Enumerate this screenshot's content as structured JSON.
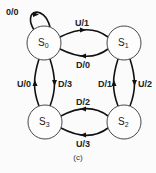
{
  "diagram": {
    "type": "state-machine",
    "caption": "(c)",
    "states": [
      {
        "id": "S0",
        "name": "S",
        "sub": "0",
        "cx": 44,
        "cy": 43
      },
      {
        "id": "S1",
        "name": "S",
        "sub": "1",
        "cx": 124,
        "cy": 43
      },
      {
        "id": "S2",
        "name": "S",
        "sub": "2",
        "cx": 124,
        "cy": 122
      },
      {
        "id": "S3",
        "name": "S",
        "sub": "3",
        "cx": 45,
        "cy": 122
      }
    ],
    "transitions": [
      {
        "from": "S0",
        "to": "S0",
        "label": "0/0"
      },
      {
        "from": "S0",
        "to": "S1",
        "label": "U/1"
      },
      {
        "from": "S1",
        "to": "S0",
        "label": "D/0"
      },
      {
        "from": "S1",
        "to": "S2",
        "label": "U/2"
      },
      {
        "from": "S2",
        "to": "S1",
        "label": "D/1"
      },
      {
        "from": "S2",
        "to": "S3",
        "label": "D/2"
      },
      {
        "from": "S3",
        "to": "S2",
        "label": "U/3"
      },
      {
        "from": "S3",
        "to": "S0",
        "label": "U/0"
      },
      {
        "from": "S0",
        "to": "S3",
        "label": "D/3"
      }
    ]
  }
}
